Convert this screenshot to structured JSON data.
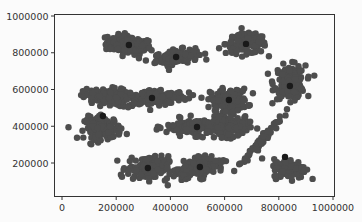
{
  "chart_data": {
    "type": "scatter",
    "title": "",
    "xlabel": "",
    "ylabel": "",
    "xlim": [
      -30000,
      1010000
    ],
    "ylim": [
      -10000,
      1000000
    ],
    "grid": false,
    "legend": null,
    "x_ticks": [
      0,
      200000,
      400000,
      600000,
      800000,
      1000000
    ],
    "x_tick_labels": [
      "0",
      "200000",
      "400000",
      "600000",
      "800000",
      "1000000"
    ],
    "y_ticks": [
      200000,
      400000,
      600000,
      800000,
      1000000
    ],
    "y_tick_labels": [
      "200000",
      "400000",
      "600000",
      "800000",
      "1000000"
    ],
    "point_color": "#4d4d4d",
    "centroid_color": "#1a1a1a",
    "series": [
      {
        "name": "points",
        "clusters": [
          {
            "center": [
              247000,
              842000
            ],
            "spread": [
              55000,
              32000
            ],
            "count": 150,
            "angle": -10
          },
          {
            "center": [
              421000,
              777000
            ],
            "spread": [
              52000,
              25000
            ],
            "count": 130,
            "angle": 12
          },
          {
            "center": [
              679000,
              848000
            ],
            "spread": [
              50000,
              35000
            ],
            "count": 140,
            "angle": 0
          },
          {
            "center": [
              841000,
              640000
            ],
            "spread": [
              38000,
              60000
            ],
            "count": 160,
            "angle": 0
          },
          {
            "center": [
              332000,
              554000
            ],
            "spread": [
              85000,
              30000
            ],
            "count": 160,
            "angle": 5
          },
          {
            "center": [
              160000,
              560000
            ],
            "spread": [
              55000,
              30000
            ],
            "count": 120,
            "angle": 0
          },
          {
            "center": [
              616000,
              543000
            ],
            "spread": [
              45000,
              40000
            ],
            "count": 150,
            "angle": 0
          },
          {
            "center": [
              151000,
              390000
            ],
            "spread": [
              45000,
              40000
            ],
            "count": 130,
            "angle": 0
          },
          {
            "center": [
              498000,
              396000
            ],
            "spread": [
              75000,
              30000
            ],
            "count": 150,
            "angle": 0
          },
          {
            "center": [
              620000,
              400000
            ],
            "spread": [
              45000,
              40000
            ],
            "count": 120,
            "angle": 0
          },
          {
            "center": [
              317000,
              173000
            ],
            "spread": [
              50000,
              42000
            ],
            "count": 150,
            "angle": 0
          },
          {
            "center": [
              509000,
              178000
            ],
            "spread": [
              60000,
              35000
            ],
            "count": 140,
            "angle": 25
          },
          {
            "center": [
              840000,
              170000
            ],
            "spread": [
              40000,
              35000
            ],
            "count": 130,
            "angle": 0
          },
          {
            "center": [
              740000,
              330000
            ],
            "spread": [
              8000,
              100000
            ],
            "count": 70,
            "angle": -30
          }
        ]
      },
      {
        "name": "centroids",
        "points": [
          [
            247000,
            842000
          ],
          [
            421000,
            777000
          ],
          [
            679000,
            848000
          ],
          [
            841000,
            619000
          ],
          [
            332000,
            554000
          ],
          [
            616000,
            543000
          ],
          [
            151000,
            456000
          ],
          [
            498000,
            396000
          ],
          [
            317000,
            173000
          ],
          [
            509000,
            178000
          ],
          [
            823000,
            233000
          ]
        ]
      }
    ]
  }
}
